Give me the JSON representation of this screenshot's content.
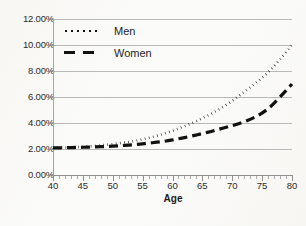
{
  "chart_data": {
    "type": "line",
    "title": "",
    "xlabel": "Age",
    "ylabel": "",
    "xlim": [
      40,
      80
    ],
    "ylim": [
      0,
      12
    ],
    "grid": true,
    "legend_position": "top-left",
    "value_suffix": "%",
    "x_tick_labels": [
      "40",
      "45",
      "50",
      "55",
      "60",
      "65",
      "70",
      "75",
      "80"
    ],
    "x_tick_values": [
      40,
      45,
      50,
      55,
      60,
      65,
      70,
      75,
      80
    ],
    "x_minor_tick_step": 1,
    "y_tick_labels": [
      "0.00%",
      "2.00%",
      "4.00%",
      "6.00%",
      "8.00%",
      "10.00%",
      "12.00%"
    ],
    "y_tick_values": [
      0,
      2,
      4,
      6,
      8,
      10,
      12
    ],
    "x": [
      40,
      42,
      44,
      46,
      48,
      50,
      52,
      54,
      56,
      58,
      60,
      62,
      64,
      66,
      68,
      70,
      72,
      74,
      76,
      78,
      80
    ],
    "series": [
      {
        "name": "Men",
        "style": "dotted",
        "color": "#111111",
        "values": [
          2.1,
          2.12,
          2.15,
          2.2,
          2.28,
          2.38,
          2.5,
          2.65,
          2.85,
          3.1,
          3.4,
          3.75,
          4.15,
          4.6,
          5.1,
          5.7,
          6.4,
          7.1,
          7.9,
          8.9,
          10.0
        ]
      },
      {
        "name": "Women",
        "style": "dashed",
        "color": "#111111",
        "values": [
          2.08,
          2.1,
          2.12,
          2.15,
          2.18,
          2.22,
          2.28,
          2.35,
          2.45,
          2.55,
          2.7,
          2.88,
          3.08,
          3.3,
          3.55,
          3.8,
          4.1,
          4.5,
          5.1,
          6.0,
          7.0
        ]
      }
    ]
  },
  "legend": {
    "items": [
      {
        "label": "Men",
        "marker": "dotted-line-marker"
      },
      {
        "label": "Women",
        "marker": "dashed-line-marker"
      }
    ]
  },
  "axes": {
    "x_title": "Age"
  }
}
